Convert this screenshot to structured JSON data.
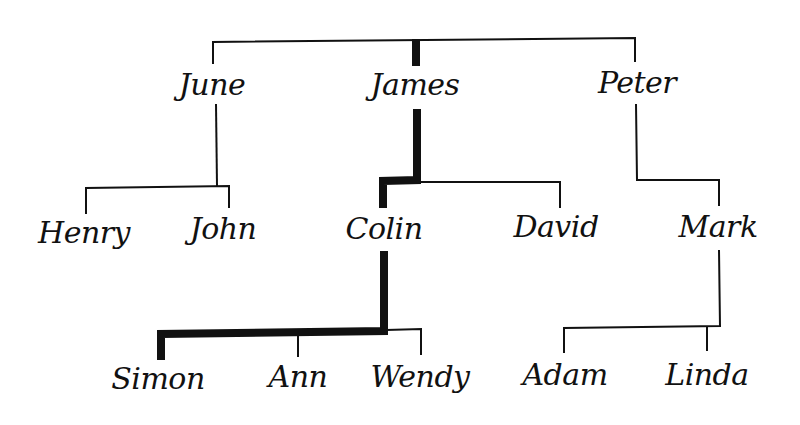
{
  "diagram": {
    "type": "family-tree",
    "colors": {
      "line": "#111111",
      "highlight": "#111111",
      "text": "#111111",
      "background": "#ffffff"
    },
    "generations": [
      {
        "level": 1,
        "members": [
          "June",
          "James",
          "Peter"
        ]
      },
      {
        "level": 2,
        "members": [
          "Henry",
          "John",
          "Colin",
          "David",
          "Mark"
        ]
      },
      {
        "level": 3,
        "members": [
          "Simon",
          "Ann",
          "Wendy",
          "Adam",
          "Linda"
        ]
      }
    ],
    "people": {
      "june": {
        "name": "June",
        "x": 212,
        "y": 70
      },
      "james": {
        "name": "James",
        "x": 415,
        "y": 70
      },
      "peter": {
        "name": "Peter",
        "x": 637,
        "y": 68
      },
      "henry": {
        "name": "Henry",
        "x": 84,
        "y": 218
      },
      "john": {
        "name": "John",
        "x": 223,
        "y": 214
      },
      "colin": {
        "name": "Colin",
        "x": 384,
        "y": 214
      },
      "david": {
        "name": "David",
        "x": 556,
        "y": 212
      },
      "mark": {
        "name": "Mark",
        "x": 718,
        "y": 212
      },
      "simon": {
        "name": "Simon",
        "x": 158,
        "y": 364
      },
      "ann": {
        "name": "Ann",
        "x": 298,
        "y": 362
      },
      "wendy": {
        "name": "Wendy",
        "x": 420,
        "y": 362
      },
      "adam": {
        "name": "Adam",
        "x": 565,
        "y": 360
      },
      "linda": {
        "name": "Linda",
        "x": 707,
        "y": 360
      }
    },
    "relationships": [
      {
        "parent": "James",
        "children": [
          "Colin",
          "David"
        ]
      },
      {
        "parent": "June",
        "children": [
          "Henry",
          "John"
        ]
      },
      {
        "parent": "Peter",
        "children": [
          "Mark"
        ]
      },
      {
        "parent": "Colin",
        "children": [
          "Simon",
          "Ann",
          "Wendy"
        ]
      },
      {
        "parent": "Mark",
        "children": [
          "Adam",
          "Linda"
        ]
      }
    ],
    "highlighted_path": [
      "James",
      "Colin",
      "Simon"
    ]
  }
}
